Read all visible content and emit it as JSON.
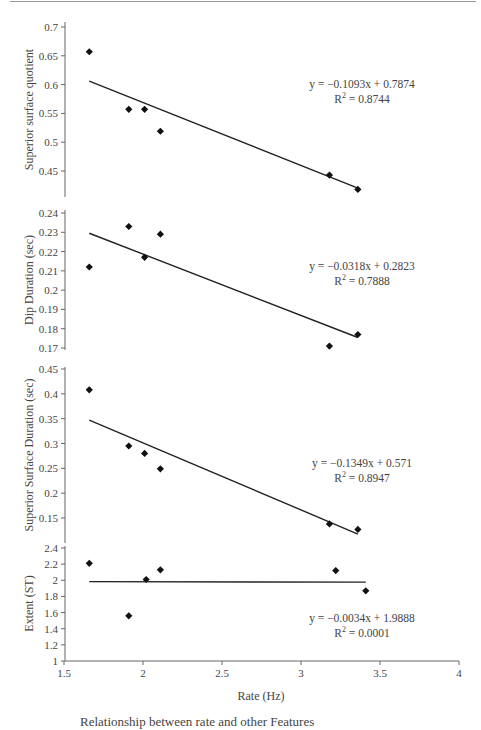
{
  "page": {
    "caption": "Relationship between rate and other Features"
  },
  "chart_data": [
    {
      "type": "scatter",
      "title": "",
      "xlabel": "Rate (Hz)",
      "ylabel": "Superior surface quotient",
      "xlim": [
        1.5,
        4
      ],
      "ylim": [
        0.41,
        0.7
      ],
      "yticks": [
        0.45,
        0.5,
        0.55,
        0.6,
        0.65,
        0.7
      ],
      "x": [
        1.66,
        1.91,
        2.01,
        2.11,
        3.18,
        3.36
      ],
      "y": [
        0.657,
        0.557,
        0.557,
        0.519,
        0.443,
        0.418
      ],
      "trendline": {
        "slope": -0.1093,
        "intercept": 0.7874,
        "x_range": [
          1.66,
          3.36
        ],
        "equation": "y = −0.1093x + 0.7874",
        "r2_label": "R",
        "r2_sup": "2",
        "r2_value": " = 0.8744"
      },
      "grid": false
    },
    {
      "type": "scatter",
      "title": "",
      "xlabel": "Rate (Hz)",
      "ylabel": "Dip Duration (sec)",
      "xlim": [
        1.5,
        4
      ],
      "ylim": [
        0.17,
        0.24
      ],
      "yticks": [
        0.17,
        0.18,
        0.19,
        0.2,
        0.21,
        0.22,
        0.23,
        0.24
      ],
      "x": [
        1.66,
        1.91,
        2.01,
        2.11,
        3.18,
        3.36
      ],
      "y": [
        0.212,
        0.233,
        0.217,
        0.229,
        0.171,
        0.177
      ],
      "trendline": {
        "slope": -0.0318,
        "intercept": 0.2823,
        "x_range": [
          1.66,
          3.36
        ],
        "equation": "y = −0.0318x + 0.2823",
        "r2_label": "R",
        "r2_sup": "2",
        "r2_value": " = 0.7888"
      },
      "grid": false
    },
    {
      "type": "scatter",
      "title": "",
      "xlabel": "Rate (Hz)",
      "ylabel": "Superior Surface Duration (sec)",
      "xlim": [
        1.5,
        4
      ],
      "ylim": [
        0.1,
        0.45
      ],
      "yticks": [
        0.15,
        0.2,
        0.25,
        0.3,
        0.35,
        0.4,
        0.45
      ],
      "x": [
        1.66,
        1.91,
        2.01,
        2.11,
        3.18,
        3.36
      ],
      "y": [
        0.408,
        0.295,
        0.28,
        0.249,
        0.138,
        0.127
      ],
      "trendline": {
        "slope": -0.1349,
        "intercept": 0.571,
        "x_range": [
          1.66,
          3.36
        ],
        "equation": "y = −0.1349x + 0.571",
        "r2_label": "R",
        "r2_sup": "2",
        "r2_value": " = 0.8947"
      },
      "grid": false
    },
    {
      "type": "scatter",
      "title": "",
      "xlabel": "Rate (Hz)",
      "ylabel": "Extent (ST)",
      "xlim": [
        1.5,
        4
      ],
      "ylim": [
        1,
        2.4
      ],
      "yticks": [
        1,
        1.2,
        1.4,
        1.6,
        1.8,
        2,
        2.2,
        2.4
      ],
      "xticks": [
        1.5,
        2,
        2.5,
        3,
        3.5,
        4
      ],
      "x": [
        1.66,
        1.91,
        2.02,
        2.11,
        3.22,
        3.41
      ],
      "y": [
        2.21,
        1.56,
        2.01,
        2.13,
        2.12,
        1.87
      ],
      "trendline": {
        "slope": -0.0034,
        "intercept": 1.9888,
        "x_range": [
          1.66,
          3.41
        ],
        "equation": "y = −0.0034x + 1.9888",
        "r2_label": "R",
        "r2_sup": "2",
        "r2_value": " = 0.0001"
      },
      "grid": false
    }
  ],
  "layout": {
    "x_px_at_1_5": 64,
    "px_per_x_unit": 158,
    "panels": [
      {
        "v_top": 0.7,
        "px_top": 27,
        "v_bot": 0.45,
        "px_bot": 171,
        "axis_top": 22,
        "axis_bot": 197,
        "eq_x": 362,
        "eq_y": 88
      },
      {
        "v_top": 0.24,
        "px_top": 213,
        "v_bot": 0.17,
        "px_bot": 348,
        "axis_top": 210,
        "axis_bot": 350,
        "eq_x": 362,
        "eq_y": 270
      },
      {
        "v_top": 0.45,
        "px_top": 369,
        "v_bot": 0.15,
        "px_bot": 518,
        "axis_top": 367,
        "axis_bot": 543,
        "eq_x": 362,
        "eq_y": 467
      },
      {
        "v_top": 2.4,
        "px_top": 548,
        "v_bot": 1.0,
        "px_bot": 661,
        "axis_top": 546,
        "axis_bot": 661,
        "eq_x": 362,
        "eq_y": 622
      }
    ],
    "colors": {
      "marker": "#111111",
      "line": "#222222",
      "axis": "#666666",
      "rule": "#888888"
    }
  }
}
